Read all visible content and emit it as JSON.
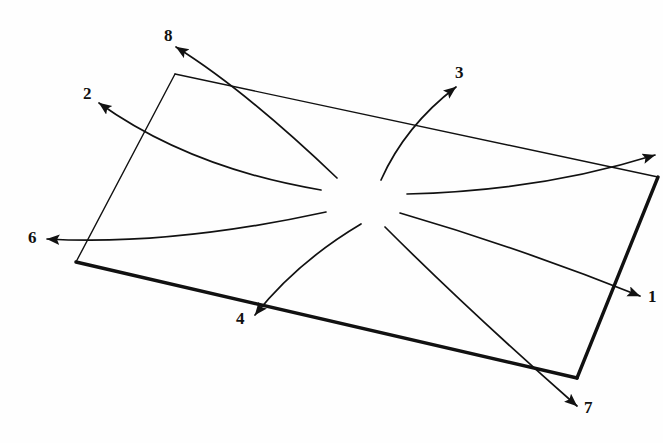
{
  "figure": {
    "background_color": "#fefefe",
    "stroke_color": "#111111",
    "canvas": {
      "width": 663,
      "height": 443
    },
    "rectangle": {
      "name": "tilted-rectangle",
      "corners": {
        "top_left": [
          175,
          74
        ],
        "top_right": [
          658,
          177
        ],
        "bottom_right": [
          577,
          378
        ],
        "bottom_left": [
          76,
          262
        ]
      },
      "thin_edge_width": 1.4,
      "thick_edge_width": 3.4,
      "thick_edges": [
        "bottom",
        "right"
      ]
    },
    "hub": {
      "x": 372,
      "y": 192
    },
    "arrows": [
      {
        "id": "1",
        "label": "1",
        "label_x": 648,
        "label_y": 288,
        "tip": [
          640,
          296
        ],
        "start": [
          400,
          213
        ],
        "control": [
          520,
          248
        ],
        "direction": "east-down"
      },
      {
        "id": "2",
        "label": "2",
        "label_x": 83,
        "label_y": 85,
        "tip": [
          99,
          103
        ],
        "start": [
          321,
          190
        ],
        "control": [
          190,
          168
        ],
        "direction": "west-up"
      },
      {
        "id": "3",
        "label": "3",
        "label_x": 455,
        "label_y": 64,
        "tip": [
          456,
          87
        ],
        "start": [
          381,
          180
        ],
        "control": [
          405,
          126
        ],
        "direction": "north-east"
      },
      {
        "id": "4",
        "label": "4",
        "label_x": 236,
        "label_y": 310,
        "tip": [
          255,
          315
        ],
        "start": [
          361,
          224
        ],
        "control": [
          297,
          262
        ],
        "direction": "south-west"
      },
      {
        "id": "5",
        "label": "",
        "label_x": 662,
        "label_y": 140,
        "tip": [
          655,
          155
        ],
        "start": [
          407,
          194
        ],
        "control": [
          540,
          191
        ],
        "direction": "east-up"
      },
      {
        "id": "6",
        "label": "6",
        "label_x": 28,
        "label_y": 229,
        "tip": [
          47,
          239
        ],
        "start": [
          326,
          212
        ],
        "control": [
          170,
          246
        ],
        "direction": "west"
      },
      {
        "id": "7",
        "label": "7",
        "label_x": 584,
        "label_y": 399,
        "tip": [
          577,
          406
        ],
        "start": [
          385,
          227
        ],
        "control": [
          468,
          310
        ],
        "direction": "south-east"
      },
      {
        "id": "8",
        "label": "8",
        "label_x": 164,
        "label_y": 27,
        "tip": [
          176,
          47
        ],
        "start": [
          337,
          178
        ],
        "control": [
          245,
          90
        ],
        "direction": "north-west"
      }
    ]
  }
}
